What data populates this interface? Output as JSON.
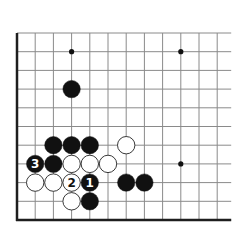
{
  "diagram": {
    "type": "go-board-fragment",
    "colors": {
      "background": "#ffffff",
      "grid_line": "#8a8a8a",
      "edge_line": "#1e1e1e",
      "black_stone": "#111111",
      "white_stone": "#ffffff",
      "white_stone_outline": "#222222",
      "star_point": "#111111"
    },
    "grid": {
      "columns": 12,
      "rows": 11,
      "origin_x": 17,
      "origin_y": 33,
      "spacing_x": 18.2,
      "spacing_y": 18.7,
      "edges": {
        "left": true,
        "bottom": true,
        "top": false,
        "right": false
      }
    },
    "star_points": [
      {
        "col": 3,
        "row": 1
      },
      {
        "col": 9,
        "row": 1
      },
      {
        "col": 9,
        "row": 7
      }
    ],
    "stones": [
      {
        "color": "black",
        "col": 3,
        "row": 3,
        "label": ""
      },
      {
        "color": "black",
        "col": 2,
        "row": 6,
        "label": ""
      },
      {
        "color": "black",
        "col": 3,
        "row": 6,
        "label": ""
      },
      {
        "color": "black",
        "col": 4,
        "row": 6,
        "label": ""
      },
      {
        "color": "white",
        "col": 6,
        "row": 6,
        "label": ""
      },
      {
        "color": "black",
        "col": 1,
        "row": 7,
        "label": "3"
      },
      {
        "color": "black",
        "col": 2,
        "row": 7,
        "label": ""
      },
      {
        "color": "white",
        "col": 3,
        "row": 7,
        "label": ""
      },
      {
        "color": "white",
        "col": 4,
        "row": 7,
        "label": ""
      },
      {
        "color": "white",
        "col": 5,
        "row": 7,
        "label": ""
      },
      {
        "color": "white",
        "col": 1,
        "row": 8,
        "label": ""
      },
      {
        "color": "white",
        "col": 2,
        "row": 8,
        "label": ""
      },
      {
        "color": "white",
        "col": 3,
        "row": 8,
        "label": "2"
      },
      {
        "color": "black",
        "col": 4,
        "row": 8,
        "label": "1"
      },
      {
        "color": "black",
        "col": 6,
        "row": 8,
        "label": ""
      },
      {
        "color": "black",
        "col": 7,
        "row": 8,
        "label": ""
      },
      {
        "color": "white",
        "col": 3,
        "row": 9,
        "label": ""
      },
      {
        "color": "black",
        "col": 4,
        "row": 9,
        "label": ""
      }
    ],
    "move_labels": [
      "1",
      "2",
      "3"
    ]
  }
}
